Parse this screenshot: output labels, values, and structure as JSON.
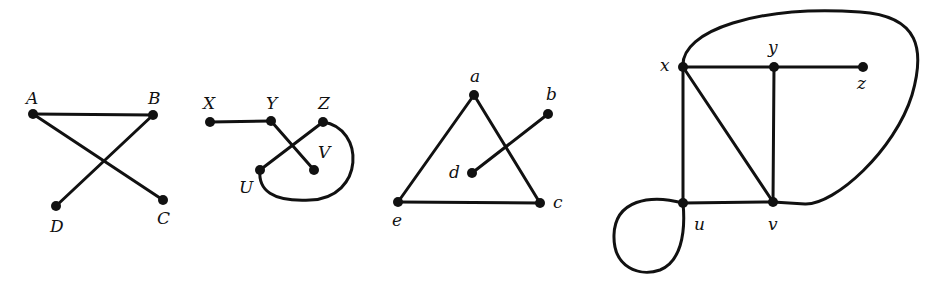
{
  "colors": {
    "ink": "#111111",
    "background": "#ffffff"
  },
  "graphs": [
    {
      "id": "graph1",
      "nodes": [
        {
          "id": "A",
          "label": "A",
          "x": 33,
          "y": 114,
          "lx": 26,
          "ly": 104
        },
        {
          "id": "B",
          "label": "B",
          "x": 153,
          "y": 115,
          "lx": 148,
          "ly": 104
        },
        {
          "id": "C",
          "label": "C",
          "x": 163,
          "y": 200,
          "lx": 157,
          "ly": 224
        },
        {
          "id": "D",
          "label": "D",
          "x": 56,
          "y": 206,
          "lx": 50,
          "ly": 232
        }
      ],
      "edges": [
        {
          "from": "A",
          "to": "B"
        },
        {
          "from": "A",
          "to": "C"
        },
        {
          "from": "B",
          "to": "D"
        }
      ]
    },
    {
      "id": "graph2",
      "nodes": [
        {
          "id": "X",
          "label": "X",
          "x": 210,
          "y": 122,
          "lx": 203,
          "ly": 109
        },
        {
          "id": "Y",
          "label": "Y",
          "x": 271,
          "y": 121,
          "lx": 266,
          "ly": 109
        },
        {
          "id": "Z",
          "label": "Z",
          "x": 323,
          "y": 122,
          "lx": 318,
          "ly": 109
        },
        {
          "id": "U",
          "label": "U",
          "x": 260,
          "y": 170,
          "lx": 239,
          "ly": 193
        },
        {
          "id": "V",
          "label": "V",
          "x": 314,
          "y": 170,
          "lx": 318,
          "ly": 158
        }
      ],
      "edges": [
        {
          "from": "X",
          "to": "Y"
        },
        {
          "from": "Y",
          "to": "V"
        },
        {
          "from": "Z",
          "to": "U"
        },
        {
          "from": "Z",
          "to": "U",
          "curved": true,
          "path": "M323,122 C365,128 365,198 310,200 C272,202 258,190 260,170"
        }
      ]
    },
    {
      "id": "graph3",
      "nodes": [
        {
          "id": "a",
          "label": "a",
          "x": 474,
          "y": 95,
          "lx": 470,
          "ly": 82
        },
        {
          "id": "b",
          "label": "b",
          "x": 548,
          "y": 114,
          "lx": 546,
          "ly": 100
        },
        {
          "id": "c",
          "label": "c",
          "x": 540,
          "y": 203,
          "lx": 553,
          "ly": 208
        },
        {
          "id": "d",
          "label": "d",
          "x": 472,
          "y": 173,
          "lx": 449,
          "ly": 178
        },
        {
          "id": "e",
          "label": "e",
          "x": 398,
          "y": 202,
          "lx": 392,
          "ly": 226
        }
      ],
      "edges": [
        {
          "from": "a",
          "to": "e"
        },
        {
          "from": "a",
          "to": "c"
        },
        {
          "from": "e",
          "to": "c"
        },
        {
          "from": "d",
          "to": "b"
        }
      ]
    },
    {
      "id": "graph4",
      "nodes": [
        {
          "id": "x",
          "label": "x",
          "x": 683,
          "y": 67,
          "lx": 660,
          "ly": 71
        },
        {
          "id": "y",
          "label": "y",
          "x": 774,
          "y": 67,
          "lx": 768,
          "ly": 53
        },
        {
          "id": "z",
          "label": "z",
          "x": 863,
          "y": 67,
          "lx": 857,
          "ly": 89
        },
        {
          "id": "u",
          "label": "u",
          "x": 683,
          "y": 203,
          "lx": 694,
          "ly": 230
        },
        {
          "id": "v",
          "label": "v",
          "x": 773,
          "y": 202,
          "lx": 768,
          "ly": 230
        }
      ],
      "edges": [
        {
          "from": "x",
          "to": "y"
        },
        {
          "from": "y",
          "to": "z"
        },
        {
          "from": "x",
          "to": "u"
        },
        {
          "from": "x",
          "to": "v"
        },
        {
          "from": "y",
          "to": "v"
        },
        {
          "from": "u",
          "to": "v"
        },
        {
          "from": "x",
          "to": "v",
          "curved": true,
          "path": "M683,67 C680,30 760,5 860,12 C920,16 925,50 912,95 C895,150 835,205 805,204 L773,202"
        },
        {
          "from": "u",
          "to": "u",
          "loop": true,
          "path": "M683,203 C650,194 615,200 614,235 C613,268 640,277 660,270 C680,262 686,235 683,203"
        }
      ]
    }
  ]
}
